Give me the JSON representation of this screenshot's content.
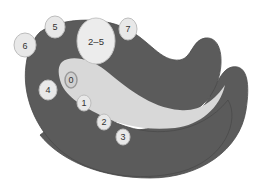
{
  "diagram": {
    "type": "curved region with numbered markers",
    "colors": {
      "background": "#ffffff",
      "outer_region": "#5b5b5b",
      "outer_edge": "#4a4a4a",
      "inner_region": "#d8d8d8",
      "marker_fill": "#e8e8e8",
      "marker_edge": "#bdbdbd",
      "ring_marker": "#9a9a9a",
      "label": "#333333"
    },
    "markers": [
      {
        "id": "m6",
        "label": "6",
        "cx": 25,
        "cy": 45,
        "rx": 11,
        "ry": 12
      },
      {
        "id": "m5",
        "label": "5",
        "cx": 55,
        "cy": 27,
        "rx": 10,
        "ry": 11
      },
      {
        "id": "m25",
        "label": "2–5",
        "cx": 96,
        "cy": 41,
        "rx": 19,
        "ry": 23
      },
      {
        "id": "m7",
        "label": "7",
        "cx": 128,
        "cy": 29,
        "rx": 9,
        "ry": 11
      },
      {
        "id": "m4",
        "label": "4",
        "cx": 48,
        "cy": 90,
        "rx": 9,
        "ry": 10
      },
      {
        "id": "m0",
        "label": "0",
        "cx": 71,
        "cy": 80,
        "rx": 6,
        "ry": 8,
        "ring": true
      },
      {
        "id": "m1",
        "label": "1",
        "cx": 84,
        "cy": 103,
        "rx": 7,
        "ry": 8
      },
      {
        "id": "m2",
        "label": "2",
        "cx": 104,
        "cy": 122,
        "rx": 7,
        "ry": 8
      },
      {
        "id": "m3",
        "label": "3",
        "cx": 123,
        "cy": 137,
        "rx": 7,
        "ry": 8
      }
    ]
  }
}
